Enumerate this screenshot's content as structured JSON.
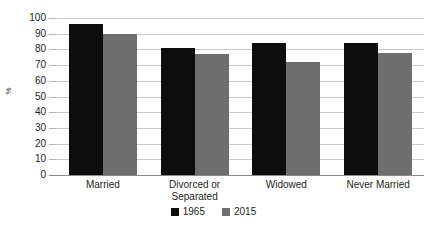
{
  "chart_data": {
    "type": "bar",
    "title": "",
    "xlabel": "",
    "ylabel": "%",
    "ylim": [
      0,
      100
    ],
    "ytick_step": 10,
    "grid": true,
    "legend_position": "bottom-center",
    "categories": [
      "Married",
      "Divorced or Separated",
      "Widowed",
      "Never Married"
    ],
    "category_lines": [
      [
        "Married"
      ],
      [
        "Divorced or",
        "Separated"
      ],
      [
        "Widowed"
      ],
      [
        "Never Married"
      ]
    ],
    "series": [
      {
        "name": "1965",
        "color": "#0d0d0d",
        "values": [
          96,
          81,
          84,
          84
        ]
      },
      {
        "name": "2015",
        "color": "#6e6e6e",
        "values": [
          90,
          77,
          72,
          78
        ]
      }
    ],
    "ytick_labels": [
      "100",
      "90",
      "80",
      "70",
      "60",
      "50",
      "40",
      "30",
      "20",
      "10",
      "0"
    ],
    "ytick_values": [
      100,
      90,
      80,
      70,
      60,
      50,
      40,
      30,
      20,
      10,
      0
    ]
  },
  "legend": {
    "items": [
      {
        "label": "1965",
        "color": "#0d0d0d"
      },
      {
        "label": "2015",
        "color": "#6e6e6e"
      }
    ]
  },
  "axis": {
    "y_title": "%"
  }
}
